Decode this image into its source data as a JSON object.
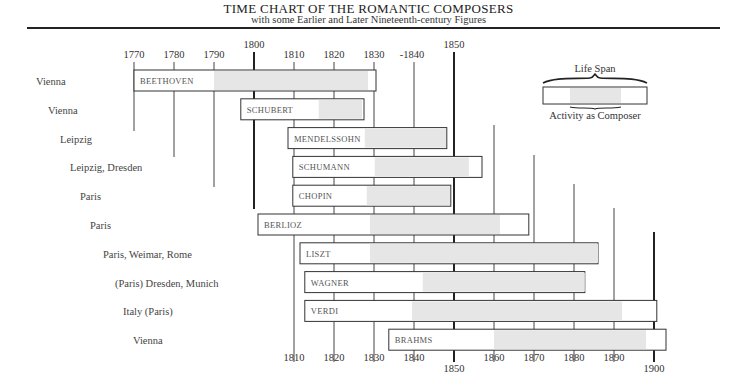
{
  "header": {
    "title": "TIME CHART OF THE ROMANTIC COMPOSERS",
    "subtitle": "with some Earlier and Later Nineteenth-century Figures"
  },
  "legend": {
    "top_label": "Life Span",
    "bottom_label": "Activity as Composer"
  },
  "chart_data": {
    "type": "gantt",
    "title": "TIME CHART OF THE ROMANTIC COMPOSERS",
    "subtitle": "with some Earlier and Later Nineteenth-century Figures",
    "xlabel": "Year",
    "xlim": [
      1770,
      1900
    ],
    "grid": true,
    "legend": [
      "Life Span",
      "Activity as Composer"
    ],
    "legend_position": "top-right",
    "top_axis_ticks": [
      "1770",
      "1780",
      "1790",
      "1800",
      "1810",
      "1820",
      "1830",
      "1840",
      "1850"
    ],
    "bottom_axis_ticks": [
      "1810",
      "1820",
      "1830",
      "1840",
      "1850",
      "1860",
      "1870",
      "1880",
      "1890",
      "1900"
    ],
    "major_ticks": [
      1800,
      1850,
      1900
    ],
    "series": [
      {
        "name": "BEETHOVEN",
        "place": "Vienna",
        "life": [
          1770,
          1830.5
        ],
        "activity": [
          1790,
          1828.5
        ]
      },
      {
        "name": "SCHUBERT",
        "place": "Vienna",
        "life": [
          1796.7,
          1827.5
        ],
        "activity": [
          1816.2,
          1827
        ]
      },
      {
        "name": "MENDELSSOHN",
        "place": "Leipzig",
        "life": [
          1808.5,
          1848.2
        ],
        "activity": [
          1827.7,
          1848
        ]
      },
      {
        "name": "SCHUMANN",
        "place": "Leipzig, Dresden",
        "life": [
          1809.7,
          1857
        ],
        "activity": [
          1830.2,
          1853.7
        ]
      },
      {
        "name": "CHOPIN",
        "place": "Paris",
        "life": [
          1809.7,
          1849.2
        ],
        "activity": [
          1828.2,
          1849
        ]
      },
      {
        "name": "BERLIOZ",
        "place": "Paris",
        "life": [
          1801,
          1868.7
        ],
        "activity": [
          1829,
          1861.5
        ]
      },
      {
        "name": "LISZT",
        "place": "Paris, Weimar, Rome",
        "life": [
          1811.5,
          1886
        ],
        "activity": [
          1829,
          1886
        ]
      },
      {
        "name": "WAGNER",
        "place": "(Paris) Dresden, Munich",
        "life": [
          1812.7,
          1882.7
        ],
        "activity": [
          1842.2,
          1882.7
        ]
      },
      {
        "name": "VERDI",
        "place": "Italy (Paris)",
        "life": [
          1812.7,
          1900.7
        ],
        "activity": [
          1839.5,
          1892
        ]
      },
      {
        "name": "BRAHMS",
        "place": "Vienna",
        "life": [
          1833.7,
          1903
        ],
        "activity": [
          1860,
          1898
        ]
      }
    ]
  },
  "layout": {
    "x0": 134,
    "year0": 1770,
    "px_per_year": 4,
    "row_top": 70,
    "row_step": 28.8,
    "bar_height": 21,
    "colors": {
      "bar_fill": "#ffffff",
      "activity_fill": "#e6e6e6",
      "stroke": "#333333",
      "grid": "#444444"
    }
  }
}
